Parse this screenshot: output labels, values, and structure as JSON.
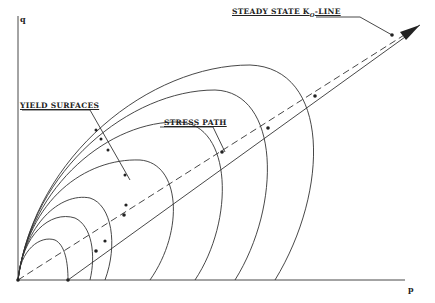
{
  "axes": {
    "x_label": "p",
    "y_label": "q"
  },
  "labels": {
    "steady_state_prefix": "STEADY STATE K",
    "steady_state_sub": "O",
    "steady_state_suffix": "-LINE",
    "yield_surfaces": "YIELD SURFACES",
    "stress_path": "STRESS PATH"
  },
  "colors": {
    "line": "#333333",
    "background": "#ffffff"
  },
  "geometry": {
    "origin": [
      18,
      280
    ],
    "yield_surface_p_intercepts": [
      68,
      90,
      105,
      150,
      195,
      235,
      275
    ],
    "stress_path_points": [
      [
        68,
        280
      ],
      [
        96,
        251
      ],
      [
        114,
        232
      ],
      [
        124,
        215
      ],
      [
        222,
        152
      ],
      [
        268,
        128
      ],
      [
        315,
        96
      ]
    ]
  }
}
